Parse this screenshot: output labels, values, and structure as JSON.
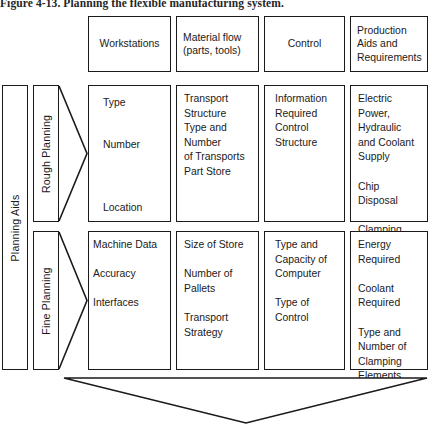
{
  "figure": {
    "caption": "Figure 4-13. Planning the flexible manufacturing system."
  },
  "left_axis": {
    "planning_aids_label": "Planning Aids",
    "rows": [
      {
        "label": "Rough Planning"
      },
      {
        "label": "Fine Planning"
      }
    ]
  },
  "columns": [
    {
      "header": "Workstations"
    },
    {
      "header": "Material flow\n(parts, tools)"
    },
    {
      "header": "Control"
    },
    {
      "header": "Production\nAids and\nRequirements"
    }
  ],
  "matrix": {
    "rough_planning": [
      {
        "text": "Type\n\nNumber\n\n\nLocation"
      },
      {
        "text": "Transport\nStructure\nType and\nNumber\nof Transports\nPart Store"
      },
      {
        "text": "Information\nRequired\nControl\nStructure"
      },
      {
        "text": "Electric\nPower,\nHydraulic\nand Coolant\nSupply\n\nChip Disposal\n\nClamping"
      }
    ],
    "fine_planning": [
      {
        "text": "Machine Data\n\nAccuracy\n\nInterfaces"
      },
      {
        "text": "Size of Store\n\nNumber of\nPallets\n\nTransport\nStrategy"
      },
      {
        "text": "Type and\nCapacity of\nComputer\n\nType of\nControl"
      },
      {
        "text": "Energy\nRequired\n\nCoolant\nRequired\n\nType and\nNumber of\nClamping\nElements"
      }
    ]
  },
  "colors": {
    "stroke": "#1a1a1a",
    "background": "#ffffff"
  }
}
